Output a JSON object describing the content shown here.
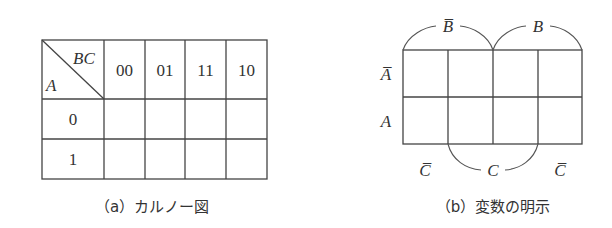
{
  "figure_a": {
    "caption": "（a）カルノー図",
    "corner": {
      "row_var": "A",
      "col_var": "BC"
    },
    "column_headers": [
      "00",
      "01",
      "11",
      "10"
    ],
    "row_headers": [
      "0",
      "1"
    ],
    "cells": [
      [
        "",
        "",
        "",
        ""
      ],
      [
        "",
        "",
        "",
        ""
      ]
    ]
  },
  "figure_b": {
    "caption": "（b）変数の明示",
    "row_labels": [
      "A̅",
      "A"
    ],
    "top_labels": [
      "B̅",
      "B"
    ],
    "bottom_labels": [
      "C̅",
      "C",
      "C̅"
    ],
    "cells": [
      [
        "",
        "",
        "",
        ""
      ],
      [
        "",
        "",
        "",
        ""
      ]
    ]
  }
}
